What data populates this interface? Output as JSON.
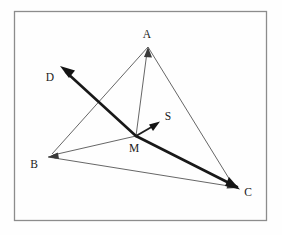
{
  "figure": {
    "background_color": "#fefefe",
    "frame": {
      "name": "figure-border",
      "x": 14,
      "y": 11,
      "width": 253,
      "height": 210,
      "stroke_color": "#8c8c8c"
    },
    "points": [
      {
        "id": "A",
        "label": "A",
        "x": 148,
        "y": 47,
        "label_x": 147,
        "label_y": 38
      },
      {
        "id": "B",
        "label": "B",
        "x": 48,
        "y": 157,
        "label_x": 34,
        "label_y": 168
      },
      {
        "id": "C",
        "label": "C",
        "x": 237,
        "y": 188,
        "label_x": 248,
        "label_y": 196
      },
      {
        "id": "D",
        "label": "D",
        "x": 62,
        "y": 68,
        "label_x": 50,
        "label_y": 81
      },
      {
        "id": "M",
        "label": "M",
        "x": 136,
        "y": 136,
        "label_x": 133,
        "label_y": 152
      },
      {
        "id": "S",
        "label": "S",
        "x": 158,
        "y": 122,
        "label_x": 167,
        "label_y": 120
      }
    ],
    "segments": [
      {
        "id": "AB",
        "from": "A",
        "to": "B",
        "style": "thin",
        "arrow_at_end": true,
        "color": "#4a4a4a"
      },
      {
        "id": "AC",
        "from": "A",
        "to": "C",
        "style": "thin",
        "arrow_at_end": true,
        "color": "#4a4a4a"
      },
      {
        "id": "BC",
        "from": "B",
        "to": "C",
        "style": "thin",
        "arrow_at_end": true,
        "color": "#4a4a4a"
      },
      {
        "id": "MA",
        "from": "M",
        "to": "A",
        "style": "thin",
        "arrow_at_end": true,
        "color": "#4a4a4a"
      },
      {
        "id": "MB",
        "from": "M",
        "to": "B",
        "style": "thin",
        "arrow_at_end": true,
        "color": "#4a4a4a"
      },
      {
        "id": "MD",
        "from": "M",
        "to": "D",
        "style": "bold",
        "arrow_at_end": true,
        "color": "#141414"
      },
      {
        "id": "MC",
        "from": "M",
        "to": "C",
        "style": "bold",
        "arrow_at_end": true,
        "color": "#141414"
      },
      {
        "id": "MS",
        "from": "M",
        "to": "S",
        "style": "medium",
        "arrow_at_end": true,
        "color": "#1f1f1f"
      }
    ],
    "labels": {
      "A": "A",
      "B": "B",
      "C": "C",
      "D": "D",
      "M": "M",
      "S": "S"
    }
  }
}
